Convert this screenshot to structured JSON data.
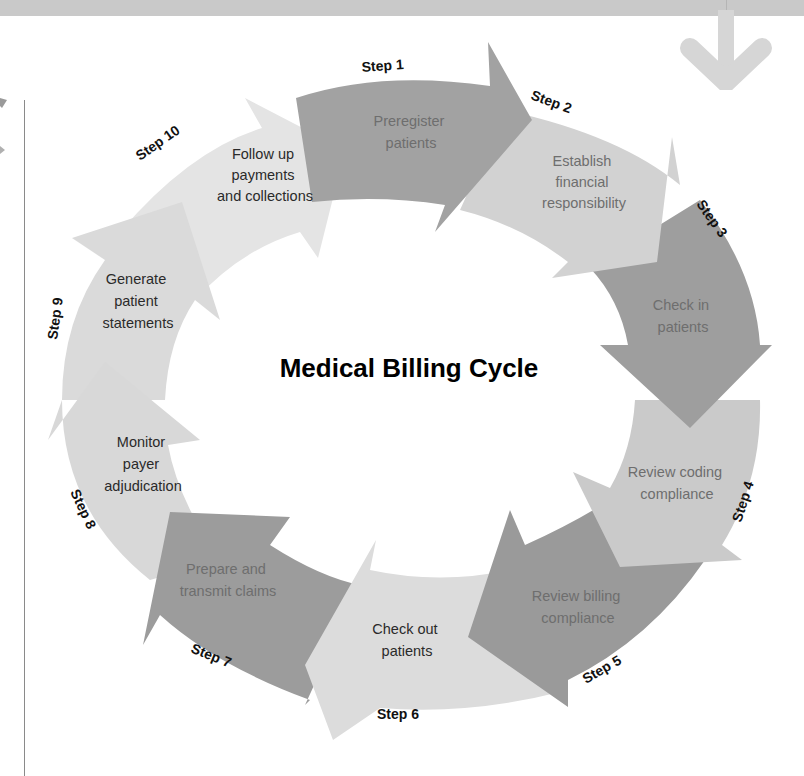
{
  "diagram": {
    "title": "Medical Billing Cycle",
    "colors": {
      "dark": "#9a9a9a",
      "medium": "#c4c4c4",
      "light": "#dcdcdc",
      "lightest": "#e6e6e6",
      "band": "#c9c9c9"
    },
    "steps": [
      {
        "step": "Step 1",
        "lines": [
          "Preregister",
          "patients"
        ]
      },
      {
        "step": "Step 2",
        "lines": [
          "Establish",
          "financial",
          "responsibility"
        ]
      },
      {
        "step": "Step 3",
        "lines": [
          "Check in",
          "patients"
        ]
      },
      {
        "step": "Step 4",
        "lines": [
          "Review coding",
          "compliance"
        ]
      },
      {
        "step": "Step 5",
        "lines": [
          "Review billing",
          "compliance"
        ]
      },
      {
        "step": "Step 6",
        "lines": [
          "Check out",
          "patients"
        ]
      },
      {
        "step": "Step 7",
        "lines": [
          "Prepare and",
          "transmit claims"
        ]
      },
      {
        "step": "Step 8",
        "lines": [
          "Monitor",
          "payer",
          "adjudication"
        ]
      },
      {
        "step": "Step 9",
        "lines": [
          "Generate",
          "patient",
          "statements"
        ]
      },
      {
        "step": "Step 10",
        "lines": [
          "Follow up",
          "payments",
          "and collections"
        ]
      }
    ]
  }
}
